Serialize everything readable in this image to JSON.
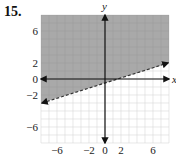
{
  "problem": {
    "number": "15."
  },
  "chart_data": {
    "type": "line",
    "title": "",
    "xlabel": "x",
    "ylabel": "y",
    "xlim": [
      -8,
      8
    ],
    "ylim": [
      -8,
      8
    ],
    "grid": true,
    "grid_step": 1,
    "x_tick_labels": [
      "-6",
      "-2",
      "0",
      "2",
      "6"
    ],
    "x_tick_values": [
      -6,
      -2,
      0,
      2,
      6
    ],
    "y_tick_labels": [
      "6",
      "2",
      "0",
      "-2",
      "-6"
    ],
    "y_tick_values": [
      6,
      2,
      0,
      -2,
      -6
    ],
    "series": [
      {
        "name": "boundary",
        "style": "dashed",
        "x": [
          -8,
          8
        ],
        "y": [
          -3,
          2
        ],
        "slope": 0.3125,
        "intercept": -0.5
      }
    ],
    "shading": {
      "region": "above",
      "color": "#a9a9a9"
    },
    "colors": {
      "shade": "#a9a9a9",
      "grid": "#d8d8d8",
      "axis": "#111111"
    }
  }
}
